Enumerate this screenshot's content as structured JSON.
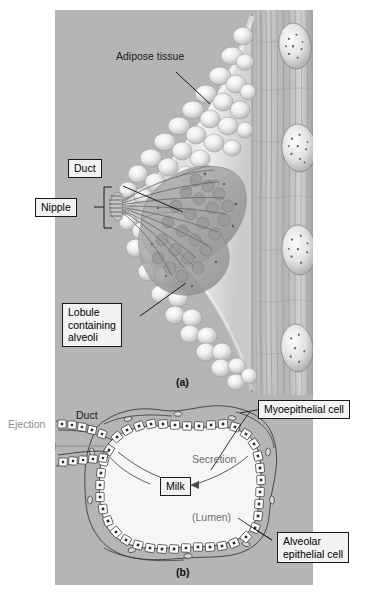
{
  "figure": {
    "background_color": "#b5b5b5",
    "label_box_fill": "#f2f2f2",
    "ink_color": "#1a1a1a",
    "muted_text_color": "#8c8c8c"
  },
  "panel_a": {
    "subfigure_label": "(a)",
    "labels": {
      "adipose": "Adipose tissue",
      "duct": "Duct",
      "nipple": "Nipple",
      "lobule": "Lobule\ncontaining\nalveoli"
    }
  },
  "panel_b": {
    "subfigure_label": "(b)",
    "labels": {
      "duct": "Duct",
      "ejection": "Ejection",
      "secretion": "Secretion",
      "milk": "Milk",
      "lumen": "(Lumen)",
      "myoepithelial": "Myoepithelial cell",
      "alveolar": "Alveolar\nepithelial cell"
    }
  },
  "caption": {
    "number": "",
    "text": ""
  }
}
